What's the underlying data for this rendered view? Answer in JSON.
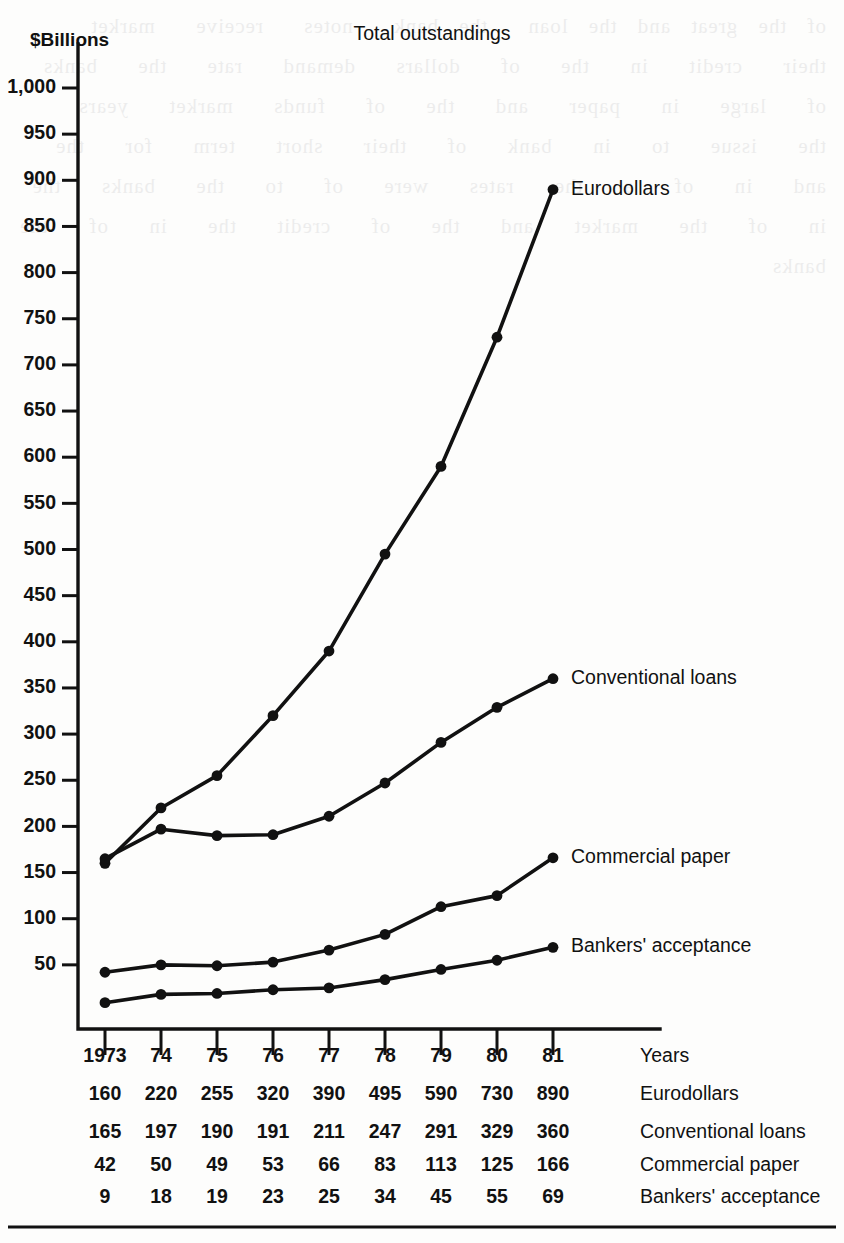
{
  "chart_data": {
    "type": "line",
    "title": "Total outstandings",
    "ylabel": "$Billions",
    "xlabel": "Years",
    "categories": [
      "1973",
      "74",
      "75",
      "76",
      "77",
      "78",
      "79",
      "80",
      "81"
    ],
    "ylim": [
      0,
      1000
    ],
    "ytick_step": 50,
    "ytick_labels": [
      "1,000",
      "950",
      "900",
      "850",
      "800",
      "750",
      "700",
      "650",
      "600",
      "550",
      "500",
      "450",
      "400",
      "350",
      "300",
      "250",
      "200",
      "150",
      "100",
      "50"
    ],
    "ytick_values": [
      1000,
      950,
      900,
      850,
      800,
      750,
      700,
      650,
      600,
      550,
      500,
      450,
      400,
      350,
      300,
      250,
      200,
      150,
      100,
      50
    ],
    "grid": false,
    "legend": "right-of-line-ends",
    "marker": "filled-circle",
    "series": [
      {
        "name": "Eurodollars",
        "values": [
          160,
          220,
          255,
          320,
          390,
          495,
          590,
          730,
          890
        ]
      },
      {
        "name": "Conventional loans",
        "values": [
          165,
          197,
          190,
          191,
          211,
          247,
          291,
          329,
          360
        ]
      },
      {
        "name": "Commercial paper",
        "values": [
          42,
          50,
          49,
          53,
          66,
          83,
          113,
          125,
          166
        ]
      },
      {
        "name": "Bankers' acceptance",
        "values": [
          9,
          18,
          19,
          23,
          25,
          34,
          45,
          55,
          69
        ]
      }
    ]
  },
  "table": {
    "row_label_header": "Years",
    "rows": [
      {
        "label": "Years",
        "values": [
          "1973",
          "74",
          "75",
          "76",
          "77",
          "78",
          "79",
          "80",
          "81"
        ]
      },
      {
        "label": "Eurodollars",
        "values": [
          "160",
          "220",
          "255",
          "320",
          "390",
          "495",
          "590",
          "730",
          "890"
        ]
      },
      {
        "label": "Conventional loans",
        "values": [
          "165",
          "197",
          "190",
          "191",
          "211",
          "247",
          "291",
          "329",
          "360"
        ]
      },
      {
        "label": "Commercial paper",
        "values": [
          "42",
          "50",
          "49",
          "53",
          "66",
          "83",
          "113",
          "125",
          "166"
        ]
      },
      {
        "label": "Bankers' acceptance",
        "values": [
          "9",
          "18",
          "19",
          "23",
          "25",
          "34",
          "45",
          "55",
          "69"
        ]
      }
    ]
  },
  "colors": {
    "ink": "#111111",
    "paper": "#fdfdfc"
  },
  "bleed_through_text": "of the great and the loan  the bank  notes  receive  market  their  credit  in  the  of  dollars  demand  rate  the  banks  of  large  in  paper  and  the  of  funds  market  years  the  issue  to  in  bank  of  their  short  term  for  the  and  in  of  a  the  rates  were  of  to  the  banks  the  in  of  the  market  and  the  of  credit  the  in  of  the  banks"
}
